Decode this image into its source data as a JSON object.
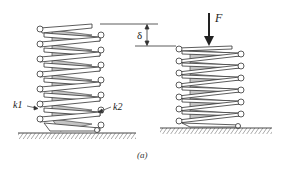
{
  "figure": {
    "caption": "(a)",
    "colors": {
      "line": "#333333",
      "coil_fill": "#ffffff",
      "coil_shade": "#bdbdbd",
      "ground": "#555555"
    },
    "left_spring": {
      "state": "uncompressed",
      "labels": {
        "outer": "k1",
        "inner": "k2"
      },
      "visible_outer_coils": 7
    },
    "right_spring": {
      "state": "compressed",
      "visible_outer_coils": 7
    },
    "force": {
      "label": "F",
      "direction": "down"
    },
    "deflection": {
      "label": "δ"
    }
  }
}
